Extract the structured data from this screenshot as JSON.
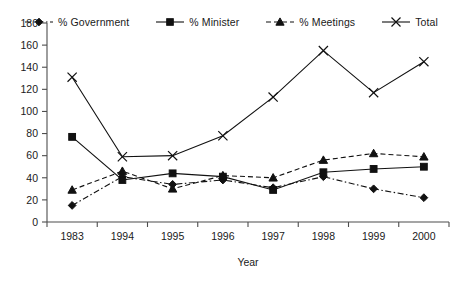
{
  "chart_data": {
    "type": "line",
    "title": "",
    "xlabel": "Year",
    "ylabel": "",
    "categories": [
      "1983",
      "1994",
      "1995",
      "1996",
      "1997",
      "1998",
      "1999",
      "2000"
    ],
    "ylim": [
      0,
      180
    ],
    "yticks": [
      0,
      20,
      40,
      60,
      80,
      100,
      120,
      140,
      160,
      180
    ],
    "grid": false,
    "legend_position": "top",
    "series": [
      {
        "name": "% Government",
        "marker": "diamond",
        "linestyle": "dash-dot",
        "color": "#111111",
        "values": [
          15,
          41,
          34,
          38,
          31,
          41,
          30,
          22
        ]
      },
      {
        "name": "% Minister",
        "marker": "square",
        "linestyle": "solid",
        "color": "#111111",
        "values": [
          77,
          38,
          44,
          41,
          29,
          45,
          48,
          50
        ]
      },
      {
        "name": "% Meetings",
        "marker": "triangle",
        "linestyle": "dashed",
        "color": "#111111",
        "values": [
          29,
          46,
          30,
          42,
          40,
          56,
          62,
          59
        ]
      },
      {
        "name": "Total",
        "marker": "cross",
        "linestyle": "solid",
        "color": "#111111",
        "values": [
          131,
          59,
          60,
          78,
          113,
          155,
          117,
          145
        ]
      }
    ]
  },
  "legend": {
    "items": [
      {
        "label": "% Government",
        "marker": "diamond",
        "linestyle": "dash-dot"
      },
      {
        "label": "% Minister",
        "marker": "square",
        "linestyle": "solid"
      },
      {
        "label": "% Meetings",
        "marker": "triangle",
        "linestyle": "dashed"
      },
      {
        "label": "Total",
        "marker": "cross",
        "linestyle": "solid"
      }
    ]
  },
  "axes": {
    "x_title": "Year",
    "y_title": ""
  }
}
